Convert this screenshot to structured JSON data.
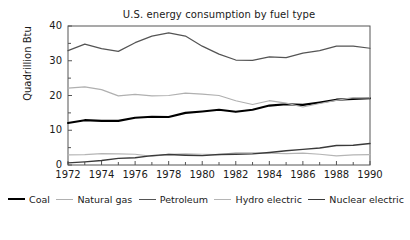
{
  "chart_data": {
    "type": "line",
    "title": "U.S. energy consumption by fuel type",
    "xlabel": "",
    "ylabel": "Quadrillion Btu",
    "xlim": [
      1972,
      1990
    ],
    "ylim": [
      0,
      40
    ],
    "grid": false,
    "legend_position": "bottom",
    "x": [
      1972,
      1973,
      1974,
      1975,
      1976,
      1977,
      1978,
      1979,
      1980,
      1981,
      1982,
      1983,
      1984,
      1985,
      1986,
      1987,
      1988,
      1989,
      1990
    ],
    "xticks": [
      1972,
      1974,
      1976,
      1978,
      1980,
      1982,
      1984,
      1986,
      1988,
      1990
    ],
    "xtick_labels": [
      "1972",
      "1974",
      "1976",
      "1978",
      "1980",
      "1982",
      "1984",
      "1986",
      "1988",
      "1990"
    ],
    "yticks": [
      0,
      10,
      20,
      30,
      40
    ],
    "ytick_labels": [
      "0",
      "10",
      "20",
      "30",
      "40"
    ],
    "series": [
      {
        "name": "Coal",
        "color": "#000000",
        "width": 2.1,
        "values": [
          12.1,
          12.9,
          12.7,
          12.7,
          13.6,
          13.9,
          13.8,
          15.0,
          15.4,
          15.9,
          15.3,
          15.9,
          17.1,
          17.5,
          17.3,
          18.0,
          18.8,
          19.0,
          19.2
        ]
      },
      {
        "name": "Natural gas",
        "color": "#b0b0b0",
        "width": 1.2,
        "values": [
          22.1,
          22.5,
          21.7,
          19.9,
          20.3,
          19.9,
          20.0,
          20.7,
          20.4,
          20.0,
          18.5,
          17.4,
          18.5,
          17.8,
          16.7,
          17.7,
          18.6,
          19.4,
          19.3
        ]
      },
      {
        "name": "Petroleum",
        "color": "#545454",
        "width": 1.2,
        "values": [
          32.9,
          34.8,
          33.5,
          32.7,
          35.2,
          37.1,
          38.0,
          37.1,
          34.2,
          31.9,
          30.2,
          30.1,
          31.1,
          30.9,
          32.2,
          32.9,
          34.2,
          34.2,
          33.6
        ]
      },
      {
        "name": "Hydro electric",
        "color": "#b5b5b5",
        "width": 1.2,
        "values": [
          2.9,
          3.0,
          3.3,
          3.2,
          3.1,
          2.5,
          3.1,
          3.2,
          3.1,
          3.0,
          3.5,
          3.5,
          3.4,
          3.3,
          3.4,
          3.1,
          2.6,
          2.9,
          3.0
        ]
      },
      {
        "name": "Nuclear electric",
        "color": "#3a3a3a",
        "width": 1.4,
        "values": [
          0.6,
          0.9,
          1.3,
          1.9,
          2.1,
          2.7,
          3.0,
          2.8,
          2.7,
          3.0,
          3.1,
          3.2,
          3.6,
          4.1,
          4.5,
          4.9,
          5.6,
          5.7,
          6.2
        ]
      }
    ]
  },
  "axes": {
    "frame_color": "#555555",
    "tick_color": "#555555"
  },
  "legend": {
    "entries": [
      {
        "label": "Coal"
      },
      {
        "label": "Natural gas"
      },
      {
        "label": "Petroleum"
      },
      {
        "label": "Hydro electric"
      },
      {
        "label": "Nuclear electric"
      }
    ]
  }
}
